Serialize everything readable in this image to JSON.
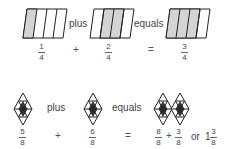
{
  "row1": {
    "shape": "parallelogram-4-parts",
    "terms": [
      {
        "numerator": "1",
        "denominator": "4",
        "shaded": 1
      },
      {
        "numerator": "2",
        "denominator": "4",
        "shaded": 2
      },
      {
        "numerator": "3",
        "denominator": "4",
        "shaded": 3
      }
    ],
    "word_plus": "plus",
    "word_equals": "equals",
    "op_plus": "+",
    "op_equals": "="
  },
  "row2": {
    "shape": "rhombus-8-parts",
    "terms": [
      {
        "numerator": "5",
        "denominator": "8"
      },
      {
        "numerator": "6",
        "denominator": "8"
      }
    ],
    "result": {
      "a_numerator": "8",
      "a_denominator": "8",
      "op": "+",
      "b_numerator": "3",
      "b_denominator": "8",
      "or": "or",
      "whole": "1",
      "mixed_numerator": "3",
      "mixed_denominator": "8"
    },
    "word_plus": "plus",
    "word_equals": "equals",
    "op_plus": "+",
    "op_equals": "="
  },
  "colors": {
    "stroke": "#222222",
    "shade": "#d4d4d4",
    "dark": "#333333"
  }
}
